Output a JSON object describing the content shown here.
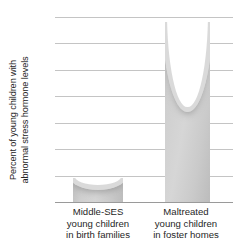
{
  "chart_data": {
    "type": "bar",
    "title": "",
    "xlabel": "",
    "ylabel": "Percent of young children with\nabnormal stress hormone levels",
    "categories": [
      "Middle-SES\nyoung children\nin birth families",
      "Maltreated\nyoung children\nin foster homes"
    ],
    "values": [
      4.5,
      34
    ],
    "ylim": [
      0,
      35
    ],
    "yticks": [
      0,
      5,
      10,
      15,
      20,
      25,
      30,
      35
    ],
    "ytick_labels": [
      "0",
      "5",
      "10",
      "15",
      "20",
      "25",
      "30",
      "35"
    ],
    "grid": true,
    "legend": "none",
    "bar_color": "#cdcdcd",
    "gridline_color": "#c4c4c4",
    "axis_color": "#9a9a9a",
    "text_color": "#1f1f1f"
  }
}
